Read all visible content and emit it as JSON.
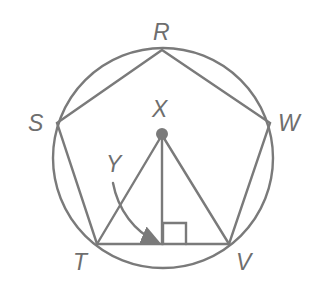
{
  "diagram": {
    "colors": {
      "stroke": "#7a7a7a",
      "label": "#6e6e6e",
      "center_dot": "#7a7a7a"
    },
    "labels": {
      "R": "R",
      "S": "S",
      "W": "W",
      "T": "T",
      "V": "V",
      "X": "X",
      "Y": "Y"
    },
    "points": {
      "R": [
        162,
        50
      ],
      "S": [
        57,
        123
      ],
      "W": [
        270,
        123
      ],
      "T": [
        97,
        244
      ],
      "V": [
        229,
        244
      ],
      "X": [
        162,
        135
      ],
      "Y": [
        163,
        244
      ]
    },
    "circle": {
      "cx": 163,
      "cy": 158,
      "r": 110
    },
    "right_angle_marker": {
      "x": 163,
      "y": 223,
      "size": 22
    }
  }
}
